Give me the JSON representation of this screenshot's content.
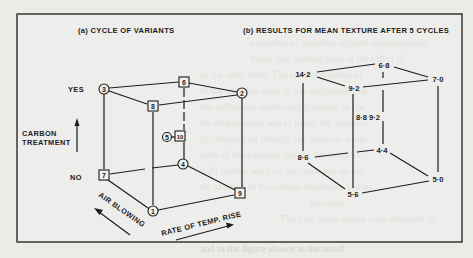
{
  "figure": {
    "border": {
      "x": 17,
      "y": 14,
      "w": 445,
      "h": 228
    },
    "colors": {
      "ink": "#1c1c1c",
      "paper": "#ebebe8",
      "bleed_text": "#d3d3cf"
    }
  },
  "panel_a": {
    "title": "(a) CYCLE OF VARIANTS",
    "vertical_axis": {
      "label_line1": "CARBON",
      "label_line2": "TREATMENT",
      "top_label": "YES",
      "bottom_label": "NO"
    },
    "depth_axis_label": "AIR BLOWING",
    "horizontal_axis_label": "RATE OF TEMP. RISE",
    "nodes": [
      {
        "id": "3",
        "shape": "circle",
        "x": 104,
        "y": 89
      },
      {
        "id": "6",
        "shape": "square",
        "x": 184,
        "y": 82
      },
      {
        "id": "2",
        "shape": "circle",
        "x": 242,
        "y": 93
      },
      {
        "id": "8",
        "shape": "square",
        "x": 153,
        "y": 106
      },
      {
        "id": "5",
        "shape": "circle",
        "x": 167,
        "y": 137
      },
      {
        "id": "10",
        "shape": "square",
        "x": 180,
        "y": 136
      },
      {
        "id": "7",
        "shape": "square",
        "x": 104,
        "y": 175
      },
      {
        "id": "4",
        "shape": "circle",
        "x": 183,
        "y": 164
      },
      {
        "id": "9",
        "shape": "square",
        "x": 240,
        "y": 193
      },
      {
        "id": "1",
        "shape": "circle",
        "x": 153,
        "y": 211
      }
    ]
  },
  "panel_b": {
    "title": "(b) RESULTS FOR MEAN TEXTURE AFTER 5 CYCLES",
    "values": [
      {
        "corner": "back-top-left",
        "label": "14·2",
        "x": 303,
        "y": 74
      },
      {
        "corner": "back-top-right-rear",
        "label": "6·8",
        "x": 383,
        "y": 65
      },
      {
        "corner": "top-right",
        "label": "7·0",
        "x": 437,
        "y": 79
      },
      {
        "corner": "front-top",
        "label": "9·2",
        "x": 353,
        "y": 88
      },
      {
        "corner": "centre",
        "label": "8·8 9·2",
        "x": 366,
        "y": 117
      },
      {
        "corner": "bottom-left",
        "label": "8·6",
        "x": 303,
        "y": 157
      },
      {
        "corner": "bottom-rear",
        "label": "4·4",
        "x": 382,
        "y": 150
      },
      {
        "corner": "bottom-right",
        "label": "5·0",
        "x": 438,
        "y": 179
      },
      {
        "corner": "front-bottom",
        "label": "5·6",
        "x": 352,
        "y": 194
      }
    ]
  },
  "background_bleed": {
    "lines": [
      "a number of variables applied independently",
      "these, like feeding tests or the effect of",
      "as the units there. The results in terms of",
      "of the samples used. It was suggested that",
      "the individual results and grouping in the",
      "the best method was to lower the variance",
      "by blowing air through the material while",
      "rates of temperature rise for the samples",
      "with further work on the coke and on the",
      "the product of the carbon treatment, and its",
      "decrease.",
      "The trial cubes above were intended to",
      "and in the figure shown as the result"
    ]
  }
}
